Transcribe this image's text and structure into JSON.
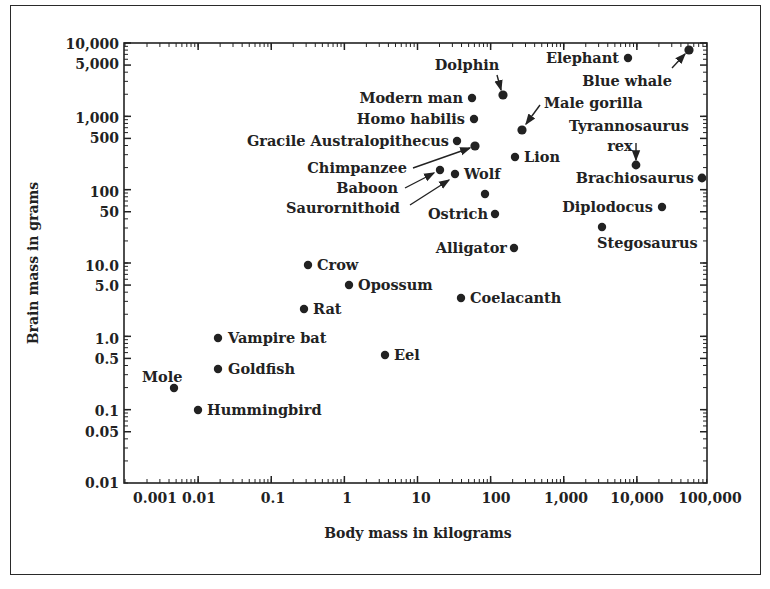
{
  "chart_data": {
    "type": "scatter",
    "title": "",
    "xlabel": "Body mass in kilograms",
    "ylabel": "Brain mass in grams",
    "xscale": "log",
    "yscale": "log",
    "xlim": [
      0.001,
      100000
    ],
    "ylim": [
      0.01,
      10000
    ],
    "grid": false,
    "legend": null,
    "x_ticks": [
      "0.001",
      "0.01",
      "0.1",
      "1",
      "10",
      "100",
      "1,000",
      "10,000",
      "100,000"
    ],
    "y_ticks": [
      "0.01",
      "0.05",
      "0.1",
      "0.5",
      "1.0",
      "5.0",
      "10.0",
      "50",
      "100",
      "500",
      "1,000",
      "5,000",
      "10,000"
    ],
    "points": [
      {
        "name": "Mole",
        "x": 0.0046,
        "y": 0.22
      },
      {
        "name": "Hummingbird",
        "x": 0.0097,
        "y": 0.11
      },
      {
        "name": "Goldfish",
        "x": 0.018,
        "y": 0.4
      },
      {
        "name": "Vampire bat",
        "x": 0.018,
        "y": 1.06
      },
      {
        "name": "Rat",
        "x": 0.26,
        "y": 2.7
      },
      {
        "name": "Crow",
        "x": 0.3,
        "y": 10.6
      },
      {
        "name": "Opossum",
        "x": 1.06,
        "y": 5.7
      },
      {
        "name": "Eel",
        "x": 3.3,
        "y": 0.62
      },
      {
        "name": "Coelacanth",
        "x": 35,
        "y": 3.8
      },
      {
        "name": "Alligator",
        "x": 180,
        "y": 18
      },
      {
        "name": "Ostrich",
        "x": 100,
        "y": 53
      },
      {
        "name": "",
        "x": 73,
        "y": 100
      },
      {
        "name": "Wolf / Saurornithoid",
        "x": 29,
        "y": 188
      },
      {
        "name": "Baboon",
        "x": 18,
        "y": 214
      },
      {
        "name": "Chimpanzee",
        "x": 54,
        "y": 455
      },
      {
        "name": "Gracile Australopithecus",
        "x": 30,
        "y": 530
      },
      {
        "name": "Homo habilis",
        "x": 52,
        "y": 1070
      },
      {
        "name": "Modern man",
        "x": 49,
        "y": 2070
      },
      {
        "name": "Dolphin",
        "x": 130,
        "y": 2260
      },
      {
        "name": "Male gorilla",
        "x": 230,
        "y": 750
      },
      {
        "name": "Lion",
        "x": 185,
        "y": 320
      },
      {
        "name": "Stegosaurus",
        "x": 2800,
        "y": 35
      },
      {
        "name": "Diplodocus",
        "x": 18000,
        "y": 66
      },
      {
        "name": "Tyrannosaurus rex",
        "x": 7800,
        "y": 250
      },
      {
        "name": "Brachiosaurus",
        "x": 63000,
        "y": 165
      },
      {
        "name": "Elephant",
        "x": 6300,
        "y": 7300
      },
      {
        "name": "Blue whale",
        "x": 42000,
        "y": 9400
      }
    ]
  },
  "labels": {
    "mole": "Mole",
    "hummingbird": "Hummingbird",
    "goldfish": "Goldfish",
    "vampire_bat": "Vampire bat",
    "rat": "Rat",
    "crow": "Crow",
    "opossum": "Opossum",
    "eel": "Eel",
    "coelacanth": "Coelacanth",
    "alligator": "Alligator",
    "ostrich": "Ostrich",
    "wolf": "Wolf",
    "saurornithoid": "Saurornithoid",
    "baboon": "Baboon",
    "chimpanzee": "Chimpanzee",
    "gracile": "Gracile Australopithecus",
    "homo_habilis": "Homo habilis",
    "modern_man": "Modern man",
    "dolphin": "Dolphin",
    "male_gorilla": "Male gorilla",
    "lion": "Lion",
    "stegosaurus": "Stegosaurus",
    "diplodocus": "Diplodocus",
    "trex_1": "Tyrannosaurus",
    "trex_2": "rex",
    "brachiosaurus": "Brachiosaurus",
    "elephant": "Elephant",
    "blue_whale": "Blue whale"
  },
  "axes": {
    "xlabel": "Body mass in kilograms",
    "ylabel": "Brain mass in grams",
    "x_ticks": [
      "0.001",
      "0.01",
      "0.1",
      "1",
      "10",
      "100",
      "1,000",
      "10,000",
      "100,000"
    ],
    "y_ticks": [
      "10,000",
      "5,000",
      "1,000",
      "500",
      "100",
      "50",
      "10.0",
      "5.0",
      "1.0",
      "0.5",
      "0.1",
      "0.05",
      "0.01"
    ]
  }
}
